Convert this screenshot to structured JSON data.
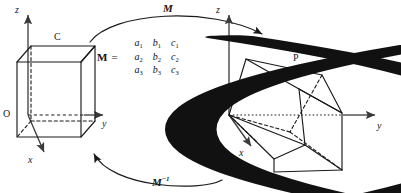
{
  "figure": {
    "stroke_color": "#1a1a1a",
    "axis_color": "#3a3a3a"
  },
  "left_frame": {
    "name": "original-cube",
    "axes": {
      "z_label": "z",
      "y_label": "y",
      "x_label": "x",
      "origin_label": "O"
    },
    "vertex_label": "C"
  },
  "right_frame": {
    "name": "transformed-cube",
    "axes": {
      "z_label": "z",
      "y_label": "y",
      "x_label": "x",
      "origin_label": "O"
    },
    "vertex_label": "P"
  },
  "arrows": {
    "forward_label": "M",
    "inverse_label": "M",
    "inverse_superscript": "−1"
  },
  "matrix": {
    "lhs": "M",
    "equals": "=",
    "rows": [
      [
        {
          "base": "a",
          "sub": "1"
        },
        {
          "base": "b",
          "sub": "1"
        },
        {
          "base": "c",
          "sub": "1"
        }
      ],
      [
        {
          "base": "a",
          "sub": "2"
        },
        {
          "base": "b",
          "sub": "2"
        },
        {
          "base": "c",
          "sub": "2"
        }
      ],
      [
        {
          "base": "a",
          "sub": "3"
        },
        {
          "base": "b",
          "sub": "3"
        },
        {
          "base": "c",
          "sub": "3"
        }
      ]
    ]
  }
}
